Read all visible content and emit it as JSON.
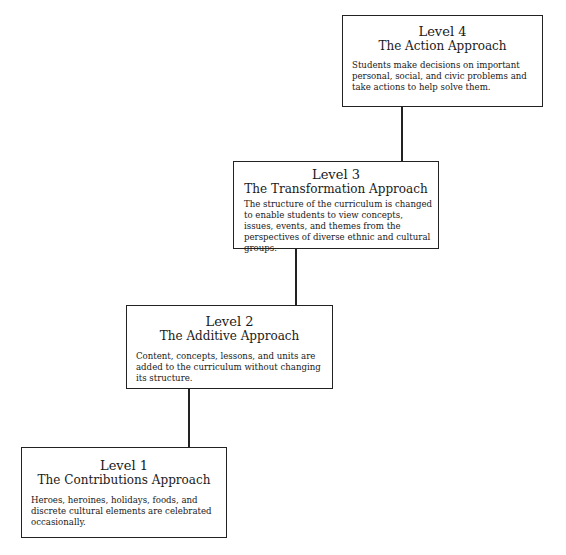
{
  "levels": [
    {
      "level": "Level 1",
      "approach": "The Contributions Approach",
      "description": "Heroes, heroines, holidays, foods, and discrete cultural elements are celebrated occasionally."
    },
    {
      "level": "Level 2",
      "approach": "The Additive Approach",
      "description": "Content, concepts, lessons, and units are added to the curriculum without changing its structure."
    },
    {
      "level": "Level 3",
      "approach": "The Transformation Approach",
      "description": "The structure of the curriculum is changed to enable students to view concepts, issues, events, and themes from the perspectives of diverse ethnic and cultural groups."
    },
    {
      "level": "Level 4",
      "approach": "The Action Approach",
      "description": "Students make decisions on important personal, social, and civic problems and take actions to help solve them."
    }
  ]
}
